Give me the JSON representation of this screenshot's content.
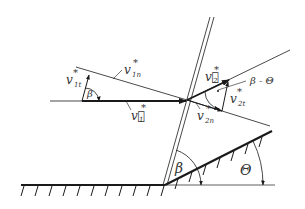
{
  "diagram": {
    "colors": {
      "stroke": "#1a1a1a",
      "text": "#333333",
      "background": "#ffffff"
    },
    "labels": {
      "v1_vec": "v⃗",
      "v1_sub": "1",
      "v1n": "v",
      "v1n_sub": "1n",
      "v1t": "v",
      "v1t_sub": "1t",
      "v2_vec": "v⃗",
      "v2_sub": "2",
      "v2t": "v",
      "v2t_sub": "2t",
      "v2n": "v",
      "v2n_sub": "2n",
      "star": "*",
      "beta_top": "β",
      "beta_minus_theta": "β - Θ",
      "beta_bottom": "β",
      "theta": "Θ"
    }
  }
}
